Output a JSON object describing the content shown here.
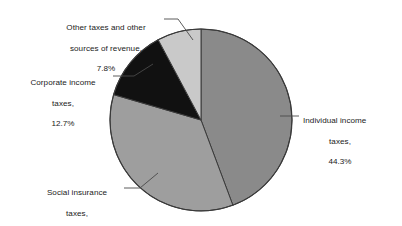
{
  "chart_data": {
    "type": "pie",
    "title": "",
    "subtitle": "",
    "xlabel": "",
    "ylabel": "",
    "legend_position": "none",
    "grid": false,
    "start_angle_deg": 0,
    "direction": "clockwise",
    "units": "percent",
    "categories": [
      "Individual income taxes",
      "Social insurance taxes",
      "Corporate income taxes",
      "Other taxes and other sources of revenue"
    ],
    "values": [
      44.3,
      35.2,
      12.7,
      7.8
    ],
    "colors": [
      "#8a8a8a",
      "#9e9e9e",
      "#111111",
      "#c9c9c9"
    ],
    "slices": [
      {
        "name": "individual-income-taxes",
        "label_lines": [
          "Individual income",
          "taxes,",
          "44.3%"
        ],
        "value": 44.3,
        "value_text": "44.3%",
        "color": "#8a8a8a",
        "start_deg": 0,
        "end_deg": 159.48
      },
      {
        "name": "social-insurance-taxes",
        "label_lines": [
          "Social insurance",
          "taxes,",
          "35.2%"
        ],
        "value": 35.2,
        "value_text": "35.2%",
        "color": "#9e9e9e",
        "start_deg": 159.48,
        "end_deg": 286.2
      },
      {
        "name": "corporate-income-taxes",
        "label_lines": [
          "Corporate income",
          "taxes,",
          "12.7%"
        ],
        "value": 12.7,
        "value_text": "12.7%",
        "color": "#111111",
        "start_deg": 286.2,
        "end_deg": 331.92
      },
      {
        "name": "other-taxes-and-other-sources-of-revenue",
        "label_lines": [
          "Other taxes and other",
          "sources of revenue,",
          "7.8%"
        ],
        "value": 7.8,
        "value_text": "7.8%",
        "color": "#c9c9c9",
        "start_deg": 331.92,
        "end_deg": 360
      }
    ]
  },
  "labels": {
    "other": {
      "line1": "Other taxes and other",
      "line2": "sources of revenue,",
      "line3": "7.8%"
    },
    "corporate": {
      "line1": "Corporate income",
      "line2": "taxes,",
      "line3": "12.7%"
    },
    "social": {
      "line1": "Social insurance",
      "line2": "taxes,",
      "line3": "35.2%"
    },
    "individual": {
      "line1": "Individual income",
      "line2": "taxes,",
      "line3": "44.3%"
    }
  },
  "style": {
    "background": "#ffffff",
    "outline": "#3a3a3a",
    "leader_line": "#4a4a4a",
    "text": "#1a1a1a"
  }
}
